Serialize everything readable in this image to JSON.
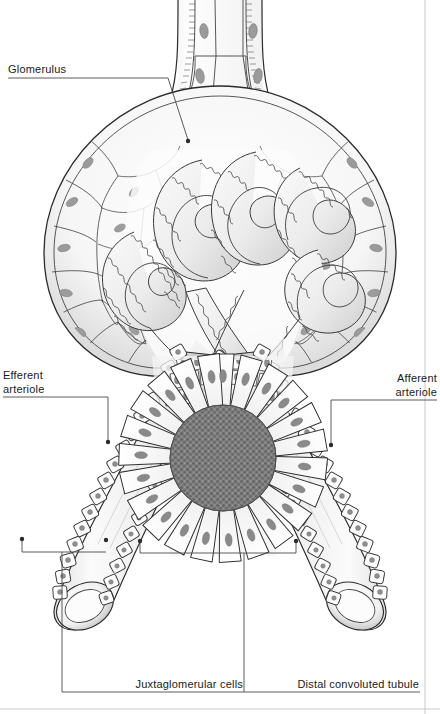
{
  "figure": {
    "title_alt": "Juxtaglomerular apparatus histology diagram",
    "background_color": "#ffffff",
    "ink_color": "#1a1a1a",
    "leader_color": "#3a3a3a",
    "width": 440,
    "height": 714
  },
  "labels": {
    "glomerulus": "Glomerulus",
    "efferent_line1": "Efferent",
    "efferent_line2": "arteriole",
    "afferent_line1": "Afferent",
    "afferent_line2": "arteriole",
    "juxtaglomerular": "Juxtaglomerular cells",
    "distal_tubule": "Distal convoluted tubule"
  },
  "structures": {
    "bowman_capsule": "bowmans-capsule",
    "glomerular_tuft": "glomerular-capillary-tuft",
    "proximal_tubule": "proximal-tubule-neck",
    "efferent_arteriole": "efferent-arteriole",
    "afferent_arteriole": "afferent-arteriole",
    "macula_densa": "macula-densa",
    "distal_tubule_cross_section": "distal-convoluted-tubule-cross-section",
    "jg_cells": "juxtaglomerular-cells"
  },
  "palette": {
    "outline": "#2b2b2b",
    "cell_fill": "#fdfdfd",
    "nucleus": "#8e8e8e",
    "shade_light": "#e8e8e8",
    "shade_mid": "#cccccc",
    "shade_dark": "#9a9a9a",
    "lumen_stipple": "#7a7a7a",
    "border_line": "#bdbdbd"
  }
}
